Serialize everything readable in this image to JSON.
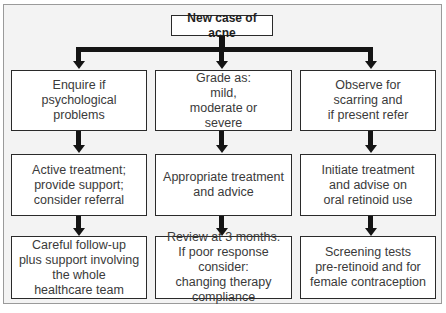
{
  "diagram": {
    "root": {
      "label": "New case of acne"
    },
    "columns": [
      {
        "steps": [
          {
            "label": "Enquire if\npsychological\nproblems"
          },
          {
            "label": "Active treatment;\nprovide support;\nconsider referral"
          },
          {
            "label": "Careful follow-up\nplus support involving\nthe whole\nhealthcare team"
          }
        ]
      },
      {
        "steps": [
          {
            "label": "Grade as:\nmild,\nmoderate or\nsevere"
          },
          {
            "label": "Appropriate treatment\nand advice"
          },
          {
            "label": "Review at 3 months.\nIf poor response consider:\nchanging therapy\ncompliance"
          }
        ]
      },
      {
        "steps": [
          {
            "label": "Observe for\nscarring and\nif present refer"
          },
          {
            "label": "Initiate treatment\nand advise on\noral retinoid use"
          },
          {
            "label": "Screening tests\npre-retinoid and for\nfemale contraception"
          }
        ]
      }
    ],
    "colors": {
      "line": "#141414",
      "box_border": "#2a2a2a",
      "background": "#f3f3f3",
      "box_fill": "#ffffff"
    }
  }
}
